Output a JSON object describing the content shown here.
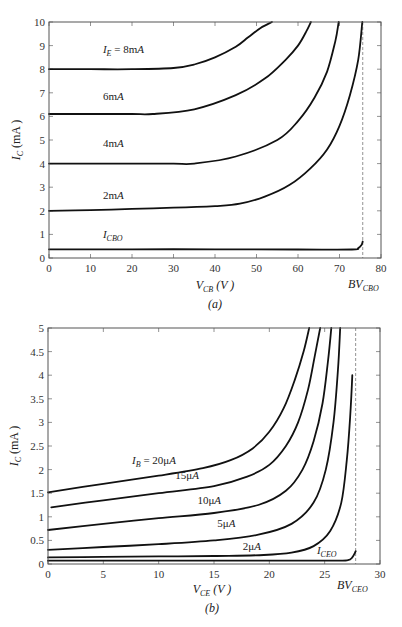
{
  "chart_data": [
    {
      "id": "a",
      "type": "line",
      "title": "",
      "caption": "(a)",
      "xlabel": "V_CB (V)",
      "ylabel": "I_C (mA)",
      "xlim": [
        0,
        80
      ],
      "ylim": [
        0,
        10
      ],
      "xticks": [
        0,
        10,
        20,
        30,
        40,
        50,
        60,
        70,
        80
      ],
      "yticks": [
        0,
        1,
        2,
        3,
        4,
        5,
        6,
        7,
        8,
        9,
        10
      ],
      "grid": false,
      "annotations": [
        {
          "text": "BV_CBO",
          "x": 75.6,
          "style": "dashed-vertical"
        }
      ],
      "series": [
        {
          "name": "I_E = 8mA",
          "label_pos": [
            13,
            8.7
          ],
          "x": [
            0,
            10,
            20,
            30,
            35,
            40,
            45,
            48,
            51,
            53.7
          ],
          "y": [
            8.0,
            8.0,
            8.0,
            8.05,
            8.2,
            8.5,
            8.95,
            9.35,
            9.75,
            10.0
          ]
        },
        {
          "name": "6mA",
          "label_pos": [
            13,
            6.7
          ],
          "x": [
            0,
            10,
            20,
            25,
            35,
            45,
            52,
            57,
            60,
            62,
            63.1
          ],
          "y": [
            6.1,
            6.1,
            6.1,
            6.1,
            6.3,
            6.9,
            7.6,
            8.4,
            9.0,
            9.6,
            10.0
          ]
        },
        {
          "name": "4mA",
          "label_pos": [
            13,
            4.7
          ],
          "x": [
            0,
            10,
            20,
            30,
            35,
            45,
            55,
            60,
            64,
            67,
            69,
            69.8
          ],
          "y": [
            4.0,
            4.0,
            4.0,
            4.0,
            4.0,
            4.3,
            5.0,
            5.8,
            6.8,
            7.9,
            9.2,
            10.0
          ]
        },
        {
          "name": "2mA",
          "label_pos": [
            13,
            2.5
          ],
          "x": [
            0,
            10,
            20,
            30,
            40,
            46,
            52,
            58,
            63,
            67,
            70,
            72.5,
            74.5,
            75.5
          ],
          "y": [
            2.0,
            2.03,
            2.08,
            2.13,
            2.2,
            2.3,
            2.6,
            3.1,
            3.8,
            4.6,
            5.6,
            6.9,
            8.4,
            10.0
          ]
        },
        {
          "name": "I_CBO",
          "label_pos": [
            13,
            0.85
          ],
          "x": [
            0,
            20,
            40,
            60,
            73,
            74.5,
            75.3,
            75.6
          ],
          "y": [
            0.37,
            0.37,
            0.37,
            0.36,
            0.36,
            0.42,
            0.55,
            0.7
          ]
        }
      ]
    },
    {
      "id": "b",
      "type": "line",
      "title": "",
      "caption": "(b)",
      "xlabel": "V_CE (V)",
      "ylabel": "I_C (mA)",
      "xlim": [
        0,
        30
      ],
      "ylim": [
        0,
        5
      ],
      "xticks": [
        0,
        5,
        10,
        15,
        20,
        25,
        30
      ],
      "yticks": [
        0,
        0.5,
        1,
        1.5,
        2,
        2.5,
        3,
        3.5,
        4,
        4.5,
        5
      ],
      "grid": false,
      "annotations": [
        {
          "text": "BV_CEO",
          "x": 27.8,
          "style": "dashed-vertical"
        }
      ],
      "series": [
        {
          "name": "I_B = 20μA",
          "label_pos": [
            7.6,
            2.12
          ],
          "x": [
            0,
            5,
            10,
            14,
            16.5,
            18.5,
            20,
            21.3,
            22.3,
            23.1,
            23.6
          ],
          "y": [
            1.52,
            1.7,
            1.87,
            2.03,
            2.2,
            2.45,
            2.8,
            3.3,
            3.9,
            4.5,
            5.0
          ]
        },
        {
          "name": "15μA",
          "label_pos": [
            11.5,
            1.8
          ],
          "x": [
            0.3,
            5,
            10,
            15,
            18,
            20,
            21.5,
            22.6,
            23.5,
            24.1,
            24.6
          ],
          "y": [
            1.2,
            1.35,
            1.5,
            1.65,
            1.85,
            2.1,
            2.5,
            3.0,
            3.7,
            4.4,
            5.0
          ]
        },
        {
          "name": "10μA",
          "label_pos": [
            13.5,
            1.28
          ],
          "x": [
            0,
            5,
            10,
            15,
            19,
            21.5,
            23,
            24,
            24.8,
            25.3,
            25.6
          ],
          "y": [
            0.72,
            0.85,
            0.97,
            1.08,
            1.25,
            1.55,
            2.0,
            2.6,
            3.4,
            4.3,
            5.0
          ]
        },
        {
          "name": "5μA",
          "label_pos": [
            15.3,
            0.78
          ],
          "x": [
            0,
            5,
            10,
            15,
            19,
            22,
            24,
            25.1,
            25.8,
            26.2,
            26.4
          ],
          "y": [
            0.3,
            0.36,
            0.42,
            0.5,
            0.62,
            0.85,
            1.3,
            2.0,
            3.0,
            4.1,
            5.0
          ]
        },
        {
          "name": "2μA",
          "label_pos": [
            17.6,
            0.3
          ],
          "x": [
            0,
            5,
            10,
            15,
            19.5,
            22,
            24,
            25.5,
            26.5,
            27.0,
            27.3,
            27.5
          ],
          "y": [
            0.14,
            0.15,
            0.16,
            0.17,
            0.19,
            0.24,
            0.38,
            0.7,
            1.3,
            2.2,
            3.1,
            4.0
          ]
        },
        {
          "name": "I_CEO",
          "label_pos": [
            24.3,
            0.22
          ],
          "x": [
            0,
            10,
            20,
            26,
            27.1,
            27.5,
            27.8
          ],
          "y": [
            0.07,
            0.07,
            0.07,
            0.07,
            0.08,
            0.14,
            0.27
          ]
        }
      ]
    }
  ],
  "labels": {
    "a": {
      "ylabel_main": "I",
      "ylabel_sub": "C",
      "ylabel_rest": " (mA )",
      "xlabel_main": "V",
      "xlabel_sub": "CB",
      "xlabel_rest": " (V )",
      "bv_main": "BV",
      "bv_sub": "CBO",
      "caption": "(a)",
      "curves": [
        {
          "main": "I",
          "sub": "E",
          "rest": " = 8mA"
        },
        {
          "main": "",
          "sub": "",
          "rest": "6mA"
        },
        {
          "main": "",
          "sub": "",
          "rest": "4mA"
        },
        {
          "main": "",
          "sub": "",
          "rest": "2mA"
        },
        {
          "main": "I",
          "sub": "CBO",
          "rest": ""
        }
      ]
    },
    "b": {
      "ylabel_main": "I",
      "ylabel_sub": "C",
      "ylabel_rest": " (mA )",
      "xlabel_main": "V",
      "xlabel_sub": "CE",
      "xlabel_rest": " (V )",
      "bv_main": "BV",
      "bv_sub": "CEO",
      "caption": "(b)",
      "curves": [
        {
          "main": "I",
          "sub": "B",
          "rest": " = 20μA"
        },
        {
          "main": "",
          "sub": "",
          "rest": "15μA"
        },
        {
          "main": "",
          "sub": "",
          "rest": "10μA"
        },
        {
          "main": "",
          "sub": "",
          "rest": "5μA"
        },
        {
          "main": "",
          "sub": "",
          "rest": "2μA"
        },
        {
          "main": "I",
          "sub": "CEO",
          "rest": ""
        }
      ]
    }
  },
  "layout": {
    "a": {
      "x0": 49,
      "x1": 381,
      "y0": 258,
      "y1": 22
    },
    "b": {
      "x0": 48,
      "x1": 380,
      "y0": 564,
      "y1": 328
    }
  }
}
